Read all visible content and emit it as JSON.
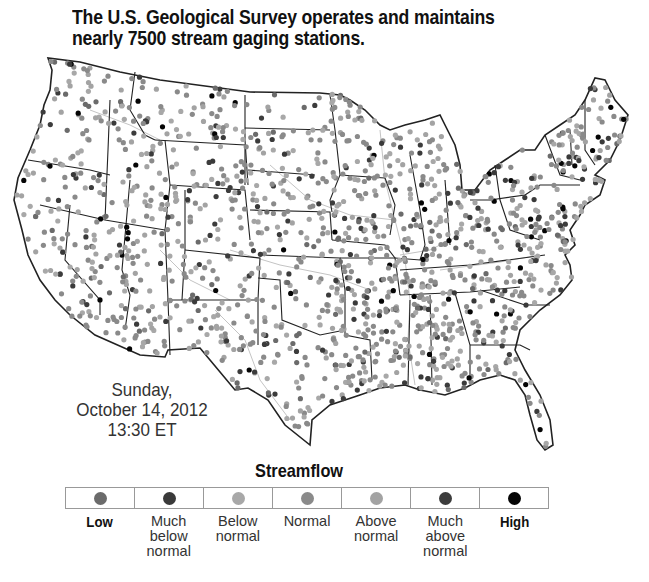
{
  "title": {
    "line1": "The U.S. Geological Survey operates and maintains",
    "line2": "nearly 7500 stream gaging stations."
  },
  "map": {
    "subject": "Contiguous United States streamflow gaging stations",
    "icon": "us-map",
    "background": "#ffffff",
    "border_color": "#222222",
    "river_color": "#bdbdbd"
  },
  "timestamp": {
    "day": "Sunday,",
    "date": "October 14, 2012",
    "time": "13:30 ET"
  },
  "legend": {
    "title": "Streamflow",
    "items": [
      {
        "label": "Low",
        "color": "#6b6b6b",
        "bold": true
      },
      {
        "label": "Much below normal",
        "color": "#3a3a3a",
        "bold": false
      },
      {
        "label": "Below normal",
        "color": "#a8a8a8",
        "bold": false
      },
      {
        "label": "Normal",
        "color": "#8a8a8a",
        "bold": false
      },
      {
        "label": "Above normal",
        "color": "#a3a3a3",
        "bold": false
      },
      {
        "label": "Much above normal",
        "color": "#3c3c3c",
        "bold": false
      },
      {
        "label": "High",
        "color": "#050505",
        "bold": true
      }
    ]
  }
}
